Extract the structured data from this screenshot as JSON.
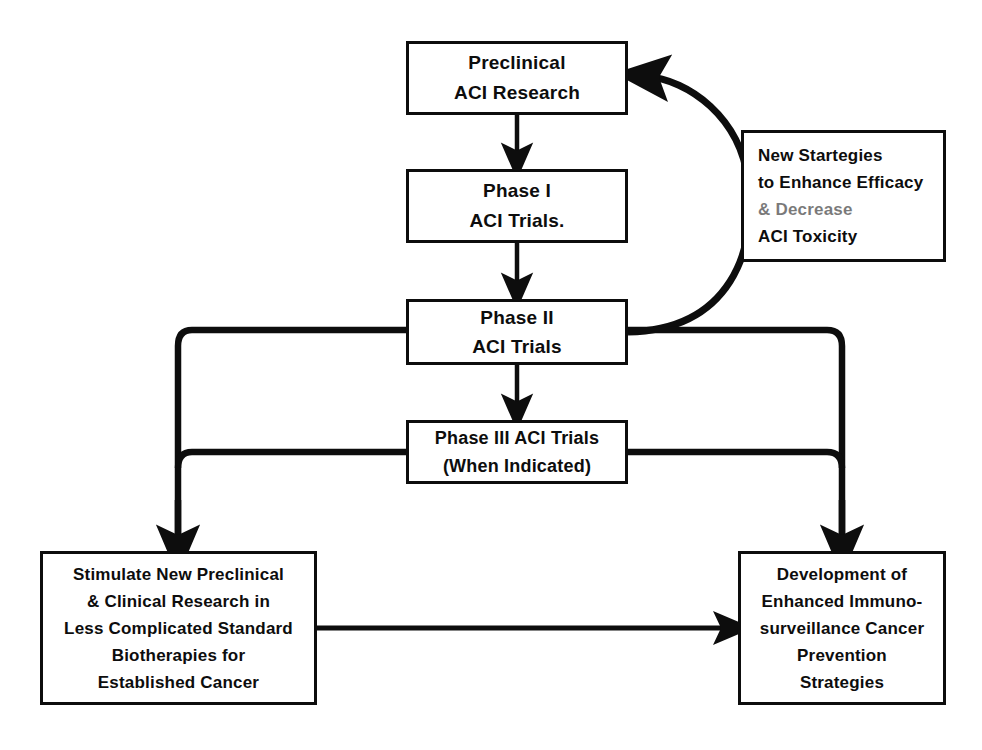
{
  "diagram": {
    "line_color": "#0d0d0d",
    "background": "#ffffff",
    "nodes": {
      "preclinical": {
        "lines": [
          "Preclinical",
          "ACI Research"
        ]
      },
      "phase1": {
        "lines": [
          "Phase I",
          "ACI Trials."
        ]
      },
      "phase2": {
        "lines": [
          "Phase II",
          "ACI Trials"
        ]
      },
      "phase3": {
        "lines": [
          "Phase III ACI Trials",
          "(When Indicated)"
        ]
      },
      "strategies": {
        "lines": [
          "New Startegies",
          "to Enhance Efficacy",
          "& Decrease",
          "ACI Toxicity"
        ]
      },
      "stimulate": {
        "lines": [
          "Stimulate New Preclinical",
          "& Clinical Research in",
          "Less Complicated Standard",
          "Biotherapies for",
          "Established Cancer"
        ]
      },
      "development": {
        "lines": [
          "Development of",
          "Enhanced Immuno-",
          "surveillance Cancer",
          "Prevention",
          "Strategies"
        ]
      }
    },
    "edges": [
      {
        "name": "preclinical-to-phase1",
        "from": "preclinical",
        "to": "phase1",
        "style": "straight-down"
      },
      {
        "name": "phase1-to-phase2",
        "from": "phase1",
        "to": "phase2",
        "style": "straight-down"
      },
      {
        "name": "phase2-to-phase3",
        "from": "phase2",
        "to": "phase3",
        "style": "straight-down"
      },
      {
        "name": "phase2-feedback-loop",
        "from": "phase2",
        "to": "preclinical",
        "style": "curved-loop-right"
      },
      {
        "name": "phase2-to-stimulate",
        "from": "phase2",
        "to": "stimulate",
        "style": "elbow-left-down"
      },
      {
        "name": "phase3-to-stimulate",
        "from": "phase3",
        "to": "stimulate",
        "style": "elbow-left-down"
      },
      {
        "name": "phase2-to-development",
        "from": "phase2",
        "to": "development",
        "style": "elbow-right-down"
      },
      {
        "name": "phase3-to-development",
        "from": "phase3",
        "to": "development",
        "style": "elbow-right-down"
      },
      {
        "name": "stimulate-to-development",
        "from": "stimulate",
        "to": "development",
        "style": "straight-right"
      }
    ]
  }
}
